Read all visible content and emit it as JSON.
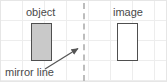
{
  "diagram": {
    "background": {
      "grid": "on",
      "grid_color": "#ededed",
      "grid_spacing_x": 22,
      "grid_spacing_y": 20,
      "border_color": "#e6e6e6",
      "paper_color": "#ffffff"
    },
    "labels": {
      "object": "object",
      "image": "image",
      "mirror": "mirror line"
    },
    "shapes": {
      "object_rect": {
        "name": "object",
        "fill": "#c9c9c9",
        "stroke": "#4f4f4f",
        "x": 30,
        "y": 22,
        "width": 21,
        "height": 38
      },
      "image_rect": {
        "name": "image",
        "fill": "#ffffff",
        "stroke": "#4f4f4f",
        "x": 116,
        "y": 22,
        "width": 21,
        "height": 38
      },
      "mirror_line": {
        "name": "mirror line",
        "style": "dashed",
        "color": "#bdbdbd",
        "x": 82,
        "y1": 2,
        "y2": 80
      },
      "arrow": {
        "name": "mirror line pointer",
        "color": "#555555",
        "from_x": 44,
        "from_y": 68,
        "to_x": 80,
        "to_y": 46
      }
    }
  }
}
